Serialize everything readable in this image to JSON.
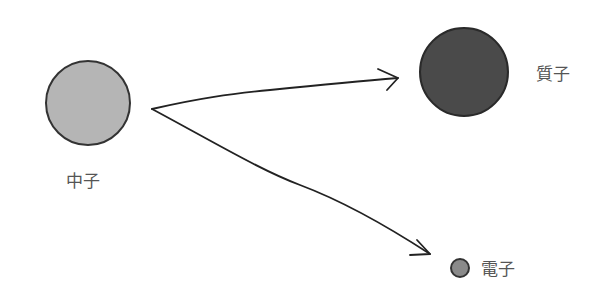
{
  "diagram": {
    "particles": [
      {
        "id": "neutron",
        "label": "中子",
        "color": "#b3b3b3",
        "stroke": "#333333"
      },
      {
        "id": "proton",
        "label": "質子",
        "color": "#4a4a4a",
        "stroke": "#2a2a2a"
      },
      {
        "id": "electron",
        "label": "電子",
        "color": "#888888",
        "stroke": "#333333"
      }
    ],
    "arrows": [
      {
        "from": "neutron",
        "to": "proton"
      },
      {
        "from": "neutron",
        "to": "electron"
      }
    ]
  }
}
